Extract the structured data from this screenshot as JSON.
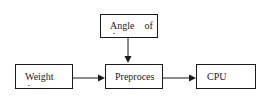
{
  "diagram": {
    "nodes": [
      {
        "id": "angle",
        "label": "Angle    of"
      },
      {
        "id": "weight",
        "label": "Weight"
      },
      {
        "id": "preproces",
        "label": "Preproces"
      },
      {
        "id": "cpu",
        "label": "CPU"
      }
    ],
    "edges": [
      {
        "from": "angle",
        "to": "preproces"
      },
      {
        "from": "weight",
        "to": "preproces"
      },
      {
        "from": "preproces",
        "to": "cpu"
      }
    ],
    "colors": {
      "stroke": "#1a1a1a",
      "background": "#ffffff"
    }
  }
}
